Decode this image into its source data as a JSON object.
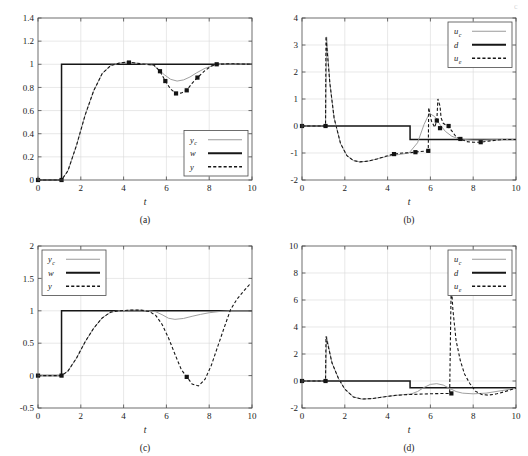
{
  "figure": {
    "title": "",
    "corner_mark": "c"
  },
  "chart_data": [
    {
      "id": "a",
      "type": "line",
      "caption": "(a)",
      "title": "",
      "xlabel": "t",
      "ylabel": "",
      "xlim": [
        0,
        10
      ],
      "ylim": [
        0,
        1.4
      ],
      "xticks": [
        0,
        2,
        4,
        6,
        8,
        10
      ],
      "xticklabels": [
        "0",
        "2",
        "4",
        "6",
        "8",
        "10"
      ],
      "yticks": [
        0,
        0.2,
        0.4,
        0.6,
        0.8,
        1.0,
        1.2,
        1.4
      ],
      "yticklabels": [
        "0",
        "0.2",
        "0.4",
        "0.6",
        "0.8",
        "1",
        "1.2",
        "1.4"
      ],
      "grid": true,
      "legend_position": "lower-right",
      "legend": [
        {
          "label": "y",
          "sub": "c",
          "style": "gray-solid"
        },
        {
          "label": "w",
          "sub": "",
          "style": "black-solid"
        },
        {
          "label": "y",
          "sub": "",
          "style": "black-dashed"
        }
      ],
      "series": [
        {
          "name": "w",
          "style": "black-solid",
          "x": [
            0,
            1.1,
            1.1,
            10
          ],
          "y": [
            0,
            0,
            1,
            1
          ]
        },
        {
          "name": "y_c",
          "style": "gray-solid",
          "x": [
            0,
            1.1,
            1.4,
            1.8,
            2.2,
            2.6,
            3.0,
            3.4,
            3.8,
            4.2,
            4.6,
            5.0,
            5.4,
            5.6,
            5.9,
            6.2,
            6.5,
            6.8,
            7.1,
            7.4,
            7.8,
            8.2,
            8.6,
            9.2,
            10
          ],
          "y": [
            0,
            0,
            0.08,
            0.3,
            0.56,
            0.77,
            0.92,
            0.99,
            1.01,
            1.02,
            1.01,
            1.0,
            0.99,
            0.96,
            0.91,
            0.87,
            0.855,
            0.865,
            0.89,
            0.925,
            0.965,
            0.99,
            1.0,
            1.0,
            1.0
          ]
        },
        {
          "name": "y",
          "style": "black-dashed",
          "x": [
            0,
            1.1,
            1.4,
            1.8,
            2.2,
            2.6,
            3.0,
            3.4,
            3.8,
            4.2,
            4.6,
            5.0,
            5.4,
            5.7,
            5.95,
            6.2,
            6.45,
            6.7,
            6.95,
            7.2,
            7.45,
            7.8,
            8.1,
            8.4,
            9.0,
            10
          ],
          "y": [
            0,
            0,
            0.08,
            0.3,
            0.56,
            0.77,
            0.92,
            0.99,
            1.01,
            1.02,
            1.01,
            1.0,
            0.995,
            0.94,
            0.855,
            0.785,
            0.748,
            0.752,
            0.775,
            0.835,
            0.885,
            0.945,
            0.985,
            1.0,
            1.005,
            1.0
          ]
        }
      ],
      "markers": [
        {
          "x": 0.0,
          "y": 0.0
        },
        {
          "x": 1.1,
          "y": 0.0
        },
        {
          "x": 4.25,
          "y": 1.015
        },
        {
          "x": 5.7,
          "y": 0.94
        },
        {
          "x": 5.95,
          "y": 0.855
        },
        {
          "x": 6.45,
          "y": 0.748
        },
        {
          "x": 6.95,
          "y": 0.775
        },
        {
          "x": 7.45,
          "y": 0.885
        },
        {
          "x": 8.35,
          "y": 1.0
        }
      ]
    },
    {
      "id": "b",
      "type": "line",
      "caption": "(b)",
      "title": "",
      "xlabel": "t",
      "ylabel": "",
      "xlim": [
        0,
        10
      ],
      "ylim": [
        -2,
        4
      ],
      "xticks": [
        0,
        2,
        4,
        6,
        8,
        10
      ],
      "xticklabels": [
        "0",
        "2",
        "4",
        "6",
        "8",
        "10"
      ],
      "yticks": [
        -2,
        -1,
        0,
        1,
        2,
        3,
        4
      ],
      "yticklabels": [
        "-2",
        "-1",
        "0",
        "1",
        "2",
        "3",
        "4"
      ],
      "grid": true,
      "legend_position": "upper-right",
      "legend": [
        {
          "label": "u",
          "sub": "c",
          "style": "gray-solid"
        },
        {
          "label": "d",
          "sub": "",
          "style": "black-solid"
        },
        {
          "label": "u",
          "sub": "e",
          "style": "black-dashed"
        }
      ],
      "series": [
        {
          "name": "d",
          "style": "black-solid",
          "x": [
            0,
            5.05,
            5.05,
            10
          ],
          "y": [
            0,
            0,
            -0.5,
            -0.5
          ]
        },
        {
          "name": "u_c",
          "style": "gray-solid",
          "x": [
            0,
            1.1,
            1.15,
            1.3,
            1.5,
            1.8,
            2.1,
            2.4,
            2.7,
            3.1,
            3.5,
            4.0,
            4.5,
            5.0,
            5.4,
            5.7,
            5.95,
            6.2,
            6.45,
            6.7,
            7.0,
            7.3,
            7.6,
            8.0,
            8.5,
            9.2,
            10
          ],
          "y": [
            0,
            0,
            3.3,
            1.6,
            0.3,
            -0.65,
            -1.1,
            -1.28,
            -1.33,
            -1.3,
            -1.22,
            -1.12,
            -1.06,
            -1.0,
            -0.62,
            0.05,
            0.47,
            0.35,
            0.05,
            -0.2,
            -0.38,
            -0.47,
            -0.5,
            -0.52,
            -0.52,
            -0.5,
            -0.5
          ]
        },
        {
          "name": "u_e",
          "style": "black-dashed",
          "x": [
            0,
            1.1,
            1.12,
            1.3,
            1.5,
            1.8,
            2.1,
            2.4,
            2.7,
            3.1,
            3.5,
            4.0,
            4.3,
            4.7,
            5.0,
            5.3,
            5.45,
            5.75,
            5.9,
            5.92,
            6.05,
            6.2,
            6.3,
            6.35,
            6.45,
            6.5,
            6.6,
            6.8,
            7.0,
            7.2,
            7.4,
            7.7,
            8.0,
            8.35,
            8.8,
            9.4,
            10
          ],
          "y": [
            0,
            0,
            3.32,
            1.6,
            0.3,
            -0.65,
            -1.1,
            -1.28,
            -1.33,
            -1.3,
            -1.22,
            -1.1,
            -1.04,
            -1.0,
            -0.99,
            -0.97,
            -0.95,
            -0.93,
            -0.92,
            0.68,
            0.18,
            -0.05,
            0.2,
            1.0,
            0.74,
            0.3,
            0.1,
            0.0,
            -0.18,
            -0.4,
            -0.48,
            -0.58,
            -0.6,
            -0.6,
            -0.55,
            -0.5,
            -0.5
          ]
        }
      ],
      "markers": [
        {
          "x": 0.0,
          "y": 0.0
        },
        {
          "x": 1.1,
          "y": 0.0
        },
        {
          "x": 4.3,
          "y": -1.04
        },
        {
          "x": 5.3,
          "y": -0.97
        },
        {
          "x": 5.9,
          "y": -0.92
        },
        {
          "x": 6.3,
          "y": 0.2
        },
        {
          "x": 6.45,
          "y": -0.08
        },
        {
          "x": 6.85,
          "y": 0.0
        },
        {
          "x": 7.4,
          "y": -0.48
        },
        {
          "x": 8.35,
          "y": -0.6
        }
      ]
    },
    {
      "id": "c",
      "type": "line",
      "caption": "(c)",
      "title": "",
      "xlabel": "t",
      "ylabel": "",
      "xlim": [
        0,
        10
      ],
      "ylim": [
        -0.5,
        2
      ],
      "xticks": [
        0,
        2,
        4,
        6,
        8,
        10
      ],
      "xticklabels": [
        "0",
        "2",
        "4",
        "6",
        "8",
        "10"
      ],
      "yticks": [
        -0.5,
        0,
        0.5,
        1,
        1.5,
        2
      ],
      "yticklabels": [
        "-0.5",
        "0",
        "0.5",
        "1",
        "1.5",
        "2"
      ],
      "grid": true,
      "legend_position": "upper-left",
      "legend": [
        {
          "label": "y",
          "sub": "c",
          "style": "gray-solid"
        },
        {
          "label": "w",
          "sub": "",
          "style": "black-solid"
        },
        {
          "label": "y",
          "sub": "",
          "style": "black-dashed"
        }
      ],
      "series": [
        {
          "name": "w",
          "style": "black-solid",
          "x": [
            0,
            1.1,
            1.1,
            10
          ],
          "y": [
            0,
            0,
            1,
            1
          ]
        },
        {
          "name": "y_c",
          "style": "gray-solid",
          "x": [
            0,
            1.1,
            1.4,
            1.8,
            2.2,
            2.6,
            3.0,
            3.4,
            3.8,
            4.3,
            4.8,
            5.2,
            5.5,
            5.8,
            6.1,
            6.4,
            6.8,
            7.2,
            7.6,
            8.0,
            8.5,
            9.0,
            10
          ],
          "y": [
            0,
            0,
            0.07,
            0.27,
            0.52,
            0.73,
            0.89,
            0.98,
            1.0,
            1.01,
            1.01,
            1.0,
            0.985,
            0.94,
            0.885,
            0.868,
            0.882,
            0.915,
            0.945,
            0.97,
            0.99,
            1.0,
            1.0
          ]
        },
        {
          "name": "y",
          "style": "black-dashed",
          "x": [
            0,
            1.1,
            1.4,
            1.8,
            2.2,
            2.6,
            3.0,
            3.4,
            3.8,
            4.3,
            4.8,
            5.2,
            5.5,
            5.8,
            6.1,
            6.4,
            6.7,
            7.0,
            7.2,
            7.5,
            7.8,
            8.1,
            8.4,
            8.7,
            9.0,
            9.3,
            9.6,
            9.95
          ],
          "y": [
            0,
            0,
            0.07,
            0.27,
            0.52,
            0.73,
            0.89,
            0.98,
            1.0,
            1.01,
            1.01,
            0.99,
            0.93,
            0.79,
            0.58,
            0.33,
            0.09,
            -0.04,
            -0.13,
            -0.16,
            -0.06,
            0.16,
            0.45,
            0.74,
            1.02,
            1.18,
            1.3,
            1.43
          ]
        }
      ],
      "markers": [
        {
          "x": 0.0,
          "y": 0.0
        },
        {
          "x": 1.1,
          "y": 0.0
        },
        {
          "x": 6.95,
          "y": -0.02
        }
      ]
    },
    {
      "id": "d",
      "type": "line",
      "caption": "(d)",
      "title": "",
      "xlabel": "t",
      "ylabel": "",
      "xlim": [
        0,
        10
      ],
      "ylim": [
        -2,
        10
      ],
      "xticks": [
        0,
        2,
        4,
        6,
        8,
        10
      ],
      "xticklabels": [
        "0",
        "2",
        "4",
        "6",
        "8",
        "10"
      ],
      "yticks": [
        -2,
        0,
        2,
        4,
        6,
        8,
        10
      ],
      "yticklabels": [
        "-2",
        "0",
        "2",
        "4",
        "6",
        "8",
        "10"
      ],
      "grid": true,
      "legend_position": "upper-right",
      "legend": [
        {
          "label": "u",
          "sub": "c",
          "style": "gray-solid"
        },
        {
          "label": "d",
          "sub": "",
          "style": "black-solid"
        },
        {
          "label": "u",
          "sub": "e",
          "style": "black-dashed"
        }
      ],
      "series": [
        {
          "name": "d",
          "style": "black-solid",
          "x": [
            0,
            5.05,
            5.05,
            10
          ],
          "y": [
            0,
            0,
            -0.5,
            -0.5
          ]
        },
        {
          "name": "u_c",
          "style": "gray-solid",
          "x": [
            0,
            1.1,
            1.15,
            1.4,
            1.7,
            2.0,
            2.4,
            2.8,
            3.3,
            3.8,
            4.3,
            4.8,
            5.1,
            5.4,
            5.7,
            6.0,
            6.3,
            6.6,
            6.9,
            7.2,
            7.5,
            8.0,
            8.6,
            9.3,
            10
          ],
          "y": [
            0,
            0,
            3.3,
            1.35,
            0.2,
            -0.6,
            -1.18,
            -1.34,
            -1.3,
            -1.18,
            -1.08,
            -1.0,
            -0.96,
            -0.78,
            -0.48,
            -0.25,
            -0.2,
            -0.3,
            -0.55,
            -0.78,
            -0.9,
            -0.95,
            -0.9,
            -0.72,
            -0.55
          ]
        },
        {
          "name": "u_e",
          "style": "black-dashed",
          "x": [
            0,
            1.1,
            1.12,
            1.4,
            1.7,
            2.0,
            2.4,
            2.8,
            3.3,
            3.8,
            4.4,
            5.0,
            5.4,
            5.9,
            6.4,
            6.9,
            6.98,
            7.0,
            7.05,
            7.2,
            7.4,
            7.6,
            7.85,
            8.1,
            8.4,
            8.7,
            9.1,
            9.5,
            10
          ],
          "y": [
            0,
            0,
            3.3,
            1.35,
            0.2,
            -0.6,
            -1.18,
            -1.34,
            -1.3,
            -1.18,
            -1.06,
            -1.0,
            -0.98,
            -0.95,
            -0.93,
            -0.92,
            8.1,
            6.6,
            5.3,
            3.0,
            1.5,
            0.5,
            -0.2,
            -0.75,
            -1.0,
            -1.05,
            -0.95,
            -0.78,
            -0.52
          ]
        }
      ],
      "markers": [
        {
          "x": 0.0,
          "y": 0.0
        },
        {
          "x": 1.1,
          "y": 0.0
        },
        {
          "x": 6.98,
          "y": -0.92
        }
      ]
    }
  ]
}
